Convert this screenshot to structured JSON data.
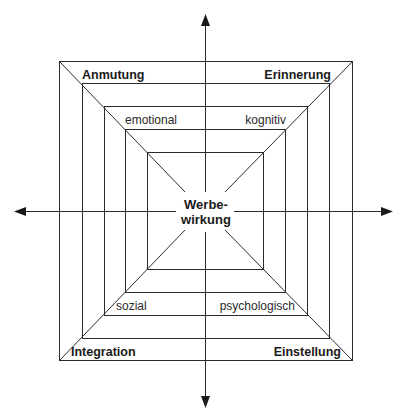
{
  "diagram": {
    "center_label": {
      "line1": "Werbe-",
      "line2": "wirkung"
    },
    "outer_labels": {
      "top_left": "Anmutung",
      "top_right": "Erinnerung",
      "bottom_left": "Integration",
      "bottom_right": "Einstellung"
    },
    "inner_labels": {
      "top_left": "emotional",
      "top_right": "kognitiv",
      "bottom_left": "sozial",
      "bottom_right": "psychologisch"
    },
    "axes": [
      "up",
      "down",
      "left",
      "right"
    ],
    "nested_squares": 5,
    "line_color": "#2b2b2b"
  }
}
